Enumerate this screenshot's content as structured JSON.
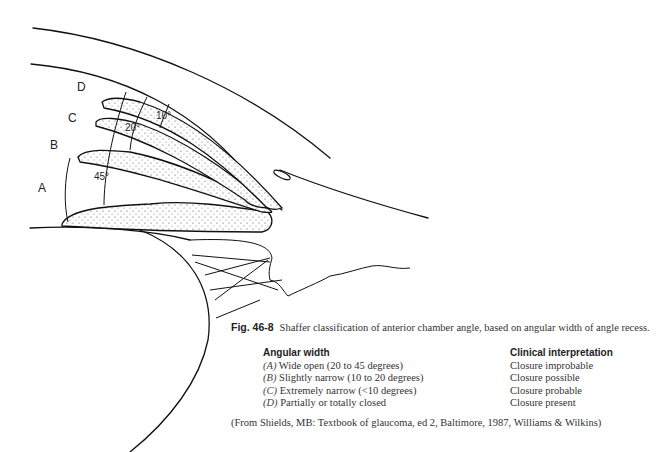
{
  "figure": {
    "labels": {
      "a": "A",
      "b": "B",
      "c": "C",
      "d": "D"
    },
    "angles": {
      "a": "45°",
      "b": "20°",
      "c": "10°"
    }
  },
  "caption": {
    "fig_number": "Fig. 46-8",
    "text": "Shaffer classification of anterior chamber angle, based on angular width of angle recess."
  },
  "table": {
    "headers": {
      "width": "Angular width",
      "interpretation": "Clinical interpretation"
    },
    "rows": [
      {
        "grade": "(A)",
        "width": "Wide open (20 to 45 degrees)",
        "interpretation": "Closure improbable"
      },
      {
        "grade": "(B)",
        "width": "Slightly narrow (10 to 20 degrees)",
        "interpretation": "Closure possible"
      },
      {
        "grade": "(C)",
        "width": "Extremely narrow (<10 degrees)",
        "interpretation": "Closure probable"
      },
      {
        "grade": "(D)",
        "width": "Partially or totally closed",
        "interpretation": "Closure present"
      }
    ]
  },
  "source": "(From Shields, MB: Textbook of glaucoma, ed 2, Baltimore, 1987, Williams & Wilkins)"
}
